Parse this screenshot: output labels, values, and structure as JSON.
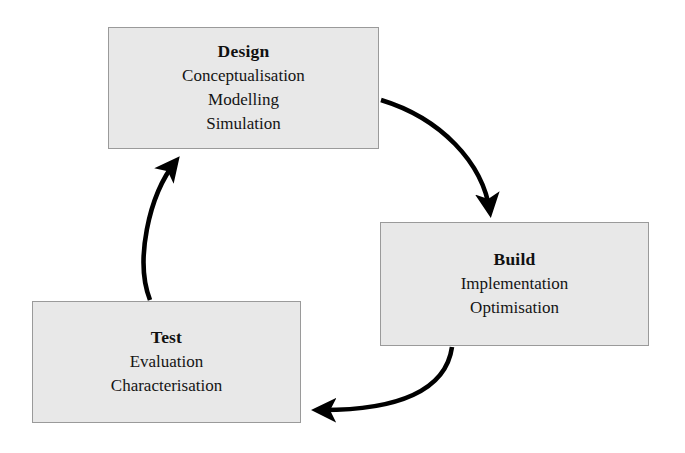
{
  "diagram": {
    "box_fill_color": "#e8e8e8",
    "box_border_color": "#9a9a9a",
    "arrow_color": "#000000",
    "background_color": "#ffffff",
    "stages": [
      {
        "id": "design",
        "title": "Design",
        "lines": [
          "Conceptualisation",
          "Modelling",
          "Simulation"
        ]
      },
      {
        "id": "build",
        "title": "Build",
        "lines": [
          "Implementation",
          "Optimisation"
        ]
      },
      {
        "id": "test",
        "title": "Test",
        "lines": [
          "Evaluation",
          "Characterisation"
        ]
      }
    ],
    "arrows": [
      {
        "id": "design-to-build",
        "from": "design",
        "to": "build",
        "label": ""
      },
      {
        "id": "build-to-test",
        "from": "build",
        "to": "test",
        "label": ""
      },
      {
        "id": "test-to-design",
        "from": "test",
        "to": "design",
        "label": ""
      }
    ]
  }
}
